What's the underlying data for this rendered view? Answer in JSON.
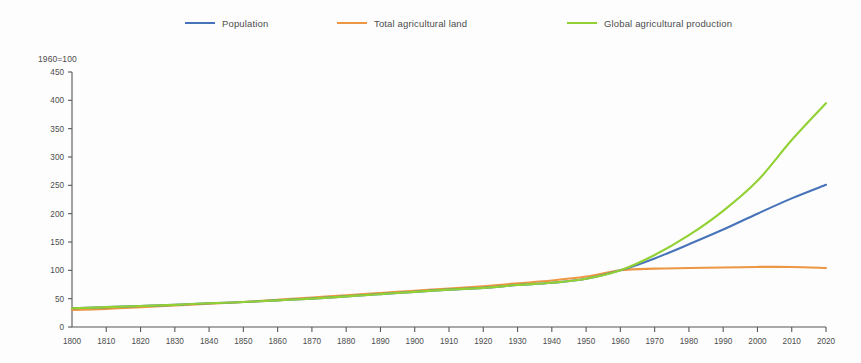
{
  "chart_data": {
    "type": "line",
    "title": "",
    "subtitle": "",
    "axis_header": "1960=100",
    "xlabel": "",
    "ylabel": "",
    "grid": false,
    "legend_position": "top",
    "xlim": [
      1800,
      2020
    ],
    "ylim": [
      0,
      450
    ],
    "ytick_step": 50,
    "xtick_step": 10,
    "x": [
      1800,
      1810,
      1820,
      1830,
      1840,
      1850,
      1860,
      1870,
      1880,
      1890,
      1900,
      1910,
      1920,
      1930,
      1940,
      1950,
      1960,
      1970,
      1980,
      1990,
      2000,
      2010,
      2020
    ],
    "xticks": [
      "1800",
      "1810",
      "1820",
      "1830",
      "1840",
      "1850",
      "1860",
      "1870",
      "1880",
      "1890",
      "1900",
      "1910",
      "1920",
      "1930",
      "1940",
      "1950",
      "1960",
      "1970",
      "1980",
      "1990",
      "2000",
      "2010",
      "2020"
    ],
    "yticks": [
      "0",
      "50",
      "100",
      "150",
      "200",
      "250",
      "300",
      "350",
      "400",
      "450"
    ],
    "series": [
      {
        "name": "Population",
        "color": "#4472b8",
        "values": [
          33,
          35,
          37,
          39,
          42,
          44,
          47,
          50,
          54,
          58,
          62,
          66,
          69,
          74,
          78,
          85,
          100,
          121,
          146,
          172,
          200,
          227,
          251
        ]
      },
      {
        "name": "Total agricultural land",
        "color": "#ed9542",
        "values": [
          30,
          32,
          35,
          38,
          41,
          44,
          48,
          52,
          56,
          60,
          64,
          68,
          72,
          77,
          82,
          89,
          100,
          103,
          104,
          105,
          106,
          106,
          104
        ]
      },
      {
        "name": "Global agricultural production",
        "color": "#8fd130",
        "values": [
          33,
          35,
          37,
          39,
          42,
          44,
          47,
          50,
          54,
          58,
          62,
          66,
          69,
          74,
          78,
          85,
          100,
          127,
          162,
          205,
          258,
          330,
          395
        ]
      }
    ]
  },
  "legend": {
    "items": [
      {
        "label": "Population",
        "color": "#4472b8"
      },
      {
        "label": "Total agricultural land",
        "color": "#ed9542"
      },
      {
        "label": "Global agricultural production",
        "color": "#8fd130"
      }
    ]
  }
}
